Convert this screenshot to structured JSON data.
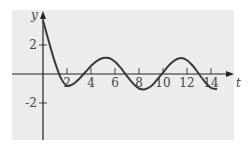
{
  "chart_data": {
    "type": "line",
    "title": "",
    "xlabel": "t",
    "ylabel": "y",
    "x_ticks": [
      2,
      4,
      6,
      8,
      10,
      12,
      14
    ],
    "y_ticks": [
      2,
      -2
    ],
    "xlim": [
      0,
      15.5
    ],
    "ylim": [
      -4.5,
      4.5
    ],
    "grid": false,
    "series": [
      {
        "name": "y(t)",
        "x": [
          0,
          0.5,
          1,
          1.5,
          2,
          2.5,
          3,
          3.5,
          4,
          4.5,
          5,
          5.5,
          6,
          6.5,
          7,
          7.5,
          8,
          8.5,
          9,
          9.5,
          10,
          10.5,
          11,
          11.5,
          12,
          12.5,
          13,
          13.5,
          14,
          14.5
        ],
        "values": [
          3.7,
          2.2,
          0.8,
          -0.3,
          -0.8,
          -0.7,
          -0.35,
          0.1,
          0.55,
          0.9,
          1.1,
          1.1,
          0.85,
          0.4,
          -0.15,
          -0.65,
          -1.0,
          -1.05,
          -0.85,
          -0.4,
          0.1,
          0.6,
          0.95,
          1.1,
          0.95,
          0.55,
          0.0,
          -0.55,
          -0.95,
          -1.05
        ]
      }
    ]
  },
  "axes": {
    "x_label": "t",
    "y_label": "y",
    "x_tick_labels": [
      "2",
      "4",
      "6",
      "8",
      "10",
      "12",
      "14"
    ],
    "y_tick_labels": [
      "2",
      "-2"
    ]
  },
  "colors": {
    "background": "#ececec",
    "curve": "#3a3a3a",
    "axis": "#222222"
  }
}
